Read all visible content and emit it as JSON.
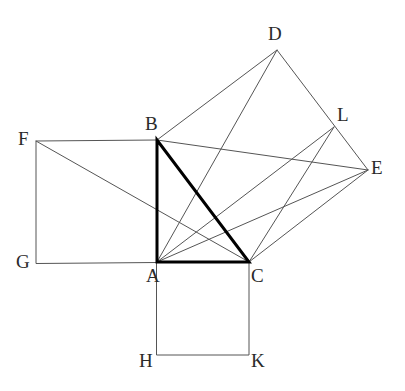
{
  "figure": {
    "canvas": {
      "width": 405,
      "height": 391,
      "background": "#ffffff"
    },
    "colors": {
      "background": "#ffffff",
      "thin_stroke": "#555555",
      "bold_stroke": "#000000",
      "label_text": "#2a2a2a"
    },
    "stroke_widths": {
      "thin": 1,
      "bold": 3
    }
  },
  "points": {
    "A": {
      "label": "A",
      "x": 157,
      "y": 262,
      "label_x": 146,
      "label_y": 266
    },
    "B": {
      "label": "B",
      "x": 157,
      "y": 140,
      "label_x": 145,
      "label_y": 114
    },
    "C": {
      "label": "C",
      "x": 249,
      "y": 262,
      "label_x": 251,
      "label_y": 266
    },
    "D": {
      "label": "D",
      "x": 277,
      "y": 50,
      "label_x": 268,
      "label_y": 24
    },
    "E": {
      "label": "E",
      "x": 368,
      "y": 170,
      "label_x": 371,
      "label_y": 158
    },
    "F": {
      "label": "F",
      "x": 36,
      "y": 141,
      "label_x": 18,
      "label_y": 129
    },
    "G": {
      "label": "G",
      "x": 36,
      "y": 263,
      "label_x": 16,
      "label_y": 252
    },
    "H": {
      "label": "H",
      "x": 157,
      "y": 355,
      "label_x": 139,
      "label_y": 351
    },
    "K": {
      "label": "K",
      "x": 249,
      "y": 355,
      "label_x": 251,
      "label_y": 351
    },
    "L": {
      "label": "L",
      "x": 334,
      "y": 127,
      "label_x": 337,
      "label_y": 105
    }
  },
  "shapes": {
    "triangle_abc": {
      "name": "right triangle ABC",
      "vertices": [
        "B",
        "A",
        "C"
      ],
      "emphasis": "bold",
      "closed": true
    },
    "square_abfg": {
      "name": "square on leg AB",
      "vertices": [
        "A",
        "B",
        "F",
        "G"
      ],
      "emphasis": "thin",
      "closed": true
    },
    "square_achk": {
      "name": "square on leg AC",
      "vertices": [
        "A",
        "C",
        "K",
        "H"
      ],
      "emphasis": "thin",
      "closed": true
    },
    "square_bdec": {
      "name": "square on hypotenuse BC",
      "vertices": [
        "B",
        "D",
        "E",
        "C"
      ],
      "emphasis": "thin",
      "closed": true
    }
  },
  "construction_lines": [
    {
      "name": "line-F-to-C",
      "from": "F",
      "to": "C",
      "emphasis": "thin"
    },
    {
      "name": "line-A-to-D",
      "from": "A",
      "to": "D",
      "emphasis": "thin"
    },
    {
      "name": "line-B-to-E",
      "from": "B",
      "to": "E",
      "emphasis": "thin"
    },
    {
      "name": "line-A-to-E",
      "from": "A",
      "to": "E",
      "emphasis": "thin"
    },
    {
      "name": "line-A-to-L",
      "from": "A",
      "to": "L",
      "emphasis": "thin"
    },
    {
      "name": "line-C-to-L",
      "from": "C",
      "to": "L",
      "emphasis": "thin"
    }
  ],
  "chart_data": {
    "type": "scatter",
    "xlabel": "",
    "ylabel": "",
    "xlim": [
      0,
      405
    ],
    "ylim": [
      0,
      391
    ],
    "grid": false,
    "legend": "none",
    "labels": [
      "A",
      "B",
      "C",
      "D",
      "E",
      "F",
      "G",
      "H",
      "K",
      "L"
    ],
    "x": [
      157,
      157,
      249,
      277,
      368,
      36,
      36,
      157,
      249,
      334
    ],
    "y": [
      262,
      140,
      262,
      50,
      170,
      141,
      263,
      355,
      355,
      127
    ],
    "annotations": [
      "Triangle ABC drawn with heavy stroke; right angle at A",
      "Square ABFG erected outward on leg AB",
      "Square ACKH erected outward on leg AC",
      "Square BDEC erected outward on hypotenuse BC",
      "Auxiliary segments FC, AD, BE, AE meet inside the figure"
    ]
  }
}
